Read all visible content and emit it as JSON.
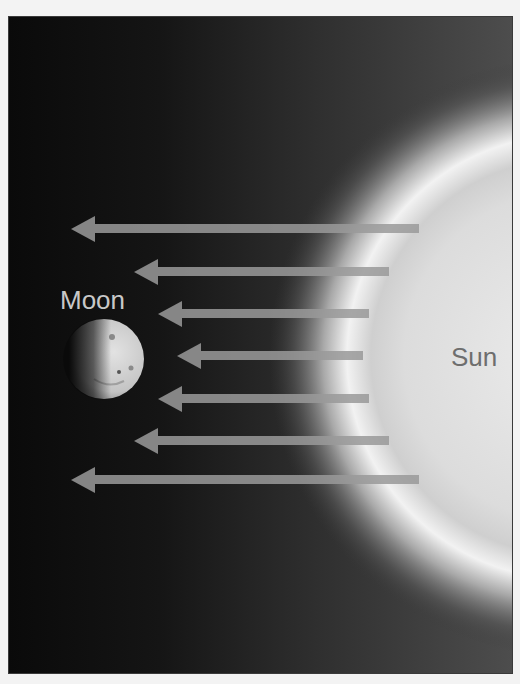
{
  "diagram": {
    "type": "sunlight illuminating the Moon",
    "labels": {
      "moon": "Moon",
      "sun": "Sun"
    },
    "colors": {
      "background_dark": "#0a0a0a",
      "background_light": "#4d4d4d",
      "arrow": "#9a9a9a",
      "sun_core": "#e6e6e6",
      "sun_glow": "#f5f5f5",
      "moon_lit": "#d8d8d8",
      "moon_text": "#c8c8c8",
      "sun_text": "#6e6e6e",
      "page_bg": "#f3f3f3"
    },
    "arrows": [
      {
        "y": 212,
        "tip_x": 62,
        "tail_x": 410
      },
      {
        "y": 255,
        "tip_x": 125,
        "tail_x": 380
      },
      {
        "y": 297,
        "tip_x": 149,
        "tail_x": 360
      },
      {
        "y": 339,
        "tip_x": 168,
        "tail_x": 354
      },
      {
        "y": 382,
        "tip_x": 149,
        "tail_x": 360
      },
      {
        "y": 424,
        "tip_x": 125,
        "tail_x": 380
      },
      {
        "y": 463,
        "tip_x": 62,
        "tail_x": 410
      }
    ],
    "arrow_direction": "from Sun toward Moon (right to left)"
  }
}
